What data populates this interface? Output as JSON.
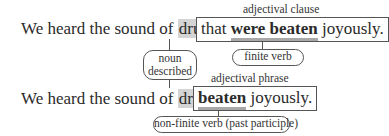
{
  "diagram": {
    "colors": {
      "highlight": "#d4d4d4",
      "underline": "#a8a8a8",
      "border": "#555555",
      "text": "#2b2b2b"
    },
    "row1": {
      "lead_text": "We heard the sound of",
      "noun": "drums",
      "box_label": "adjectival clause",
      "box_pre": "that",
      "box_verb": "were beaten",
      "box_post": "joyously.",
      "verb_bubble": "finite verb"
    },
    "noun_bubble": {
      "line1": "noun",
      "line2": "described"
    },
    "row2": {
      "lead_text": "We heard the sound of",
      "noun": "drums",
      "box_label": "adjectival phrase",
      "box_verb": "beaten",
      "box_post": "joyously.",
      "verb_bubble": "non-finite verb (past participle)"
    }
  }
}
